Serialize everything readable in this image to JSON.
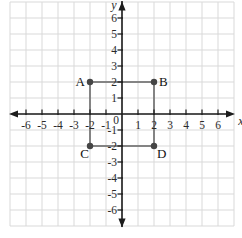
{
  "figure": {
    "origin_label": "0",
    "x_axis_label": "x",
    "y_axis_label": "y"
  },
  "chart_data": {
    "type": "scatter",
    "title": "",
    "xlabel": "x",
    "ylabel": "y",
    "xlim": [
      -7,
      7
    ],
    "ylim": [
      -7,
      7
    ],
    "grid": true,
    "x_tick_labels": [
      -6,
      -5,
      -4,
      -3,
      -2,
      -1,
      1,
      2,
      3,
      4,
      5,
      6
    ],
    "y_tick_labels": [
      -6,
      -5,
      -4,
      -3,
      -2,
      -1,
      1,
      2,
      3,
      4,
      5,
      6
    ],
    "origin_label": "0",
    "points": [
      {
        "label": "A",
        "x": -2,
        "y": 2,
        "label_pos": "left"
      },
      {
        "label": "B",
        "x": 2,
        "y": 2,
        "label_pos": "right"
      },
      {
        "label": "C",
        "x": -2,
        "y": -2,
        "label_pos": "below-left"
      },
      {
        "label": "D",
        "x": 2,
        "y": -2,
        "label_pos": "below-right"
      }
    ],
    "polygon": [
      "A",
      "B",
      "D",
      "C"
    ],
    "colors": {
      "background": "#ffffff",
      "grid": "#d9d9d9",
      "axis": "#1c1c1c",
      "tick_label": "#2a2a2a",
      "shape_edge": "#848484",
      "point_fill": "#454545",
      "vertex_label": "#111111"
    }
  }
}
